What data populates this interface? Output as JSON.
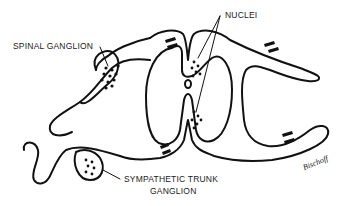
{
  "diagram": {
    "labels": {
      "spinal_ganglion": "SPINAL GANGLION",
      "nuclei": "NUCLEI",
      "sympathetic_trunk_line1": "SYMPATHETIC TRUNK",
      "sympathetic_trunk_line2": "GANGLION"
    },
    "signature": "Bischoff",
    "colors": {
      "stroke": "#111111",
      "background": "#ffffff"
    }
  }
}
